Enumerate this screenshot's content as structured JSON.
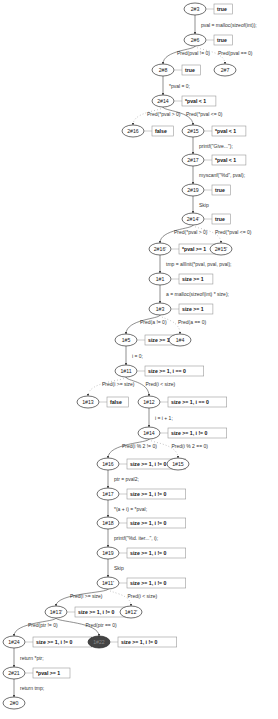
{
  "diagram": {
    "type": "abstract-reachability-graph",
    "nodes": [
      {
        "id": "2#3",
        "label": "2#3",
        "state": "true",
        "x": 195,
        "y": 9,
        "kind": "normal"
      },
      {
        "id": "2#6",
        "label": "2#6",
        "state": "true",
        "x": 195,
        "y": 40,
        "kind": "normal"
      },
      {
        "id": "2#8",
        "label": "2#8",
        "state": "true",
        "x": 163,
        "y": 70,
        "kind": "normal"
      },
      {
        "id": "2#7",
        "label": "2#7",
        "state": "",
        "x": 225,
        "y": 70,
        "kind": "normal"
      },
      {
        "id": "2#14a",
        "label": "2#14",
        "state": "*pval < 1",
        "x": 163,
        "y": 101,
        "kind": "normal"
      },
      {
        "id": "2#16a",
        "label": "2#16",
        "state": "false",
        "x": 133,
        "y": 131,
        "kind": "normal"
      },
      {
        "id": "2#15a",
        "label": "2#15",
        "state": "*pval < 1",
        "x": 193,
        "y": 131,
        "kind": "normal"
      },
      {
        "id": "2#17",
        "label": "2#17",
        "state": "*pval < 1",
        "x": 193,
        "y": 160,
        "kind": "normal"
      },
      {
        "id": "2#19",
        "label": "2#19",
        "state": "true",
        "x": 193,
        "y": 190,
        "kind": "normal"
      },
      {
        "id": "2#14b",
        "label": "2#14'",
        "state": "true",
        "x": 193,
        "y": 219,
        "kind": "normal"
      },
      {
        "id": "2#16b",
        "label": "2#16'",
        "state": "*pval >= 1",
        "x": 160,
        "y": 249,
        "kind": "normal"
      },
      {
        "id": "2#15b",
        "label": "2#15'",
        "state": "",
        "x": 221,
        "y": 249,
        "kind": "normal"
      },
      {
        "id": "1#1",
        "label": "1#1",
        "state": "size >= 1",
        "x": 160,
        "y": 279,
        "kind": "normal"
      },
      {
        "id": "1#3",
        "label": "1#3",
        "state": "size >= 1",
        "x": 160,
        "y": 309,
        "kind": "normal"
      },
      {
        "id": "1#5",
        "label": "1#5",
        "state": "size >= 1",
        "x": 126,
        "y": 340,
        "kind": "normal"
      },
      {
        "id": "1#4",
        "label": "1#4",
        "state": "",
        "x": 180,
        "y": 340,
        "kind": "normal"
      },
      {
        "id": "1#11a",
        "label": "1#11",
        "state": "size >= 1, i == 0",
        "x": 126,
        "y": 371,
        "kind": "normal"
      },
      {
        "id": "1#13a",
        "label": "1#13",
        "state": "false",
        "x": 88,
        "y": 402,
        "kind": "normal"
      },
      {
        "id": "1#12a",
        "label": "1#12",
        "state": "size >= 1, i == 0",
        "x": 149,
        "y": 402,
        "kind": "normal"
      },
      {
        "id": "1#14",
        "label": "1#14",
        "state": "size >= 1, i != 0",
        "x": 149,
        "y": 433,
        "kind": "normal"
      },
      {
        "id": "1#16",
        "label": "1#16",
        "state": "size >= 1, i != 0",
        "x": 108,
        "y": 464,
        "kind": "normal"
      },
      {
        "id": "1#15",
        "label": "1#15",
        "state": "",
        "x": 178,
        "y": 464,
        "kind": "normal"
      },
      {
        "id": "1#17",
        "label": "1#17",
        "state": "size >= 1, i != 0",
        "x": 108,
        "y": 494,
        "kind": "normal"
      },
      {
        "id": "1#18",
        "label": "1#18",
        "state": "size >= 1, i != 0",
        "x": 108,
        "y": 523,
        "kind": "normal"
      },
      {
        "id": "1#19",
        "label": "1#19",
        "state": "size >= 1, i != 0",
        "x": 108,
        "y": 553,
        "kind": "normal"
      },
      {
        "id": "1#11b",
        "label": "1#11'",
        "state": "size >= 1, i != 0",
        "x": 108,
        "y": 583,
        "kind": "normal"
      },
      {
        "id": "1#13b",
        "label": "1#13'",
        "state": "size >= 1, i != 0",
        "x": 56,
        "y": 612,
        "kind": "normal"
      },
      {
        "id": "1#12b",
        "label": "1#12'",
        "state": "",
        "x": 131,
        "y": 612,
        "kind": "normal"
      },
      {
        "id": "1#24",
        "label": "1#24",
        "state": "size >= 1, i != 0",
        "x": 14,
        "y": 642,
        "kind": "normal"
      },
      {
        "id": "1#22",
        "label": "1#22",
        "state": "size >= 1, i != 0",
        "x": 99,
        "y": 642,
        "kind": "error"
      },
      {
        "id": "2#21",
        "label": "2#21",
        "state": "*pval >= 1",
        "x": 14,
        "y": 673,
        "kind": "normal"
      },
      {
        "id": "2#0",
        "label": "2#0",
        "state": "",
        "x": 14,
        "y": 703,
        "kind": "normal"
      }
    ],
    "edges": [
      {
        "from": "2#3",
        "to": "2#6",
        "label": "pval = malloc(sizeof(int));",
        "style": "solid"
      },
      {
        "from": "2#6",
        "to": "2#8",
        "label": "Pred(pval != 0)",
        "style": "solid"
      },
      {
        "from": "2#6",
        "to": "2#7",
        "label": "Pred(pval == 0)",
        "style": "dotted"
      },
      {
        "from": "2#8",
        "to": "2#14a",
        "label": "*pval = 0;",
        "style": "solid"
      },
      {
        "from": "2#14a",
        "to": "2#16a",
        "label": "Pred(*pval > 0)",
        "style": "dotted"
      },
      {
        "from": "2#14a",
        "to": "2#15a",
        "label": "Pred(*pval <= 0)",
        "style": "solid"
      },
      {
        "from": "2#15a",
        "to": "2#17",
        "label": "printf(\"Give...\");",
        "style": "solid"
      },
      {
        "from": "2#17",
        "to": "2#19",
        "label": "myscanf(\"%d\", pval);",
        "style": "solid"
      },
      {
        "from": "2#19",
        "to": "2#14b",
        "label": "Skip",
        "style": "solid"
      },
      {
        "from": "2#14b",
        "to": "2#16b",
        "label": "Pred(*pval > 0)",
        "style": "solid"
      },
      {
        "from": "2#14b",
        "to": "2#15b",
        "label": "Pred(*pval <= 0)",
        "style": "dotted"
      },
      {
        "from": "2#16b",
        "to": "1#1",
        "label": "tmp = allInit(*pval, pval, pval);",
        "style": "solid"
      },
      {
        "from": "1#1",
        "to": "1#3",
        "label": "a = malloc(sizeof(int) * size);",
        "style": "solid"
      },
      {
        "from": "1#3",
        "to": "1#5",
        "label": "Pred(a != 0)",
        "style": "solid"
      },
      {
        "from": "1#3",
        "to": "1#4",
        "label": "Pred(a == 0)",
        "style": "dotted"
      },
      {
        "from": "1#5",
        "to": "1#11a",
        "label": "i = 0;",
        "style": "solid"
      },
      {
        "from": "1#11a",
        "to": "1#13a",
        "label": "Pred(i >= size)",
        "style": "dotted"
      },
      {
        "from": "1#11a",
        "to": "1#12a",
        "label": "Pred(i < size)",
        "style": "solid"
      },
      {
        "from": "1#12a",
        "to": "1#14",
        "label": "i = i + 1;",
        "style": "solid"
      },
      {
        "from": "1#14",
        "to": "1#16",
        "label": "Pred(i % 2 != 0)",
        "style": "solid"
      },
      {
        "from": "1#14",
        "to": "1#15",
        "label": "Pred(i % 2 == 0)",
        "style": "dotted"
      },
      {
        "from": "1#16",
        "to": "1#17",
        "label": "ptr = pval2;",
        "style": "solid"
      },
      {
        "from": "1#17",
        "to": "1#18",
        "label": "*(a + i) = *pval;",
        "style": "solid"
      },
      {
        "from": "1#18",
        "to": "1#19",
        "label": "printf(\"%d. iter...\", i);",
        "style": "solid"
      },
      {
        "from": "1#19",
        "to": "1#11b",
        "label": "Skip",
        "style": "solid"
      },
      {
        "from": "1#11b",
        "to": "1#13b",
        "label": "Pred(i >= size)",
        "style": "solid"
      },
      {
        "from": "1#11b",
        "to": "1#12b",
        "label": "Pred(i < size)",
        "style": "dotted"
      },
      {
        "from": "1#13b",
        "to": "1#24",
        "label": "Pred(ptr != 0)",
        "style": "solid"
      },
      {
        "from": "1#13b",
        "to": "1#22",
        "label": "Pred(ptr == 0)",
        "style": "solid"
      },
      {
        "from": "1#24",
        "to": "2#21",
        "label": "return *ptr;",
        "style": "solid"
      },
      {
        "from": "2#21",
        "to": "2#0",
        "label": "return tmp;",
        "style": "solid"
      }
    ],
    "colors": {
      "node_fill": "#ffffff",
      "node_stroke": "#333333",
      "error_node_fill": "#444444",
      "state_box_stroke": "#999999",
      "edge": "#444444",
      "background": "#ffffff"
    }
  }
}
